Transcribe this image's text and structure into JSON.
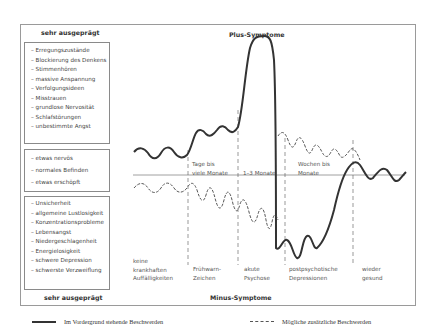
{
  "diagram": {
    "top_label": "sehr ausgeprägt",
    "bottom_label": "sehr ausgeprägt",
    "plus_label": "Plus-Symptome",
    "minus_label": "Minus-Symptome",
    "plus_symptoms": [
      "Erregungszustände",
      "Blockierung des Denkens",
      "Stimmenhören",
      "massive Anspannung",
      "Verfolgungsideen",
      "Misstrauen",
      "grundlose Nervosität",
      "Schlafstörungen",
      "unbestimmte Angst"
    ],
    "normal_states": [
      "etwas nervös",
      "normales Befinden",
      "etwas erschöpft"
    ],
    "minus_symptoms": [
      "Unsicherheit",
      "allgemeine Lustlosigkeit",
      "Konzentrationsprobleme",
      "Lebensangst",
      "Niedergeschlagenheit",
      "Energielosigkeit",
      "schwere Depression",
      "schwerste Verzweiflung"
    ],
    "durations": [
      {
        "line1": "Tage bis",
        "line2": "viele Monate"
      },
      {
        "line1": "",
        "line2": "1–3 Monate"
      },
      {
        "line1": "Wochen bis",
        "line2": "Monate"
      }
    ],
    "phases": [
      {
        "line1": "keine",
        "line2": "krankhaften",
        "line3": "Auffälligkeiten"
      },
      {
        "line1": "",
        "line2": "Frühwarn-",
        "line3": "Zeichen"
      },
      {
        "line1": "",
        "line2": "akute",
        "line3": "Psychose"
      },
      {
        "line1": "",
        "line2": "postpsychotische",
        "line3": "Depressionen"
      },
      {
        "line1": "",
        "line2": "wieder",
        "line3": "gesund"
      }
    ]
  },
  "legend": {
    "solid": "Im Vordergrund stehende Beschwerden",
    "dashed": "Mögliche zusätzliche Beschwerden"
  },
  "colors": {
    "curve": "#333333",
    "frame": "#9a9a9a",
    "text": "#3a3a3a"
  }
}
